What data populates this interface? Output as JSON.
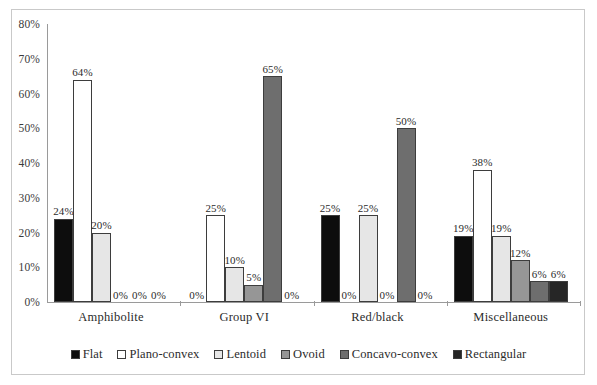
{
  "chart_data": {
    "type": "bar",
    "title": "",
    "subtitle": "",
    "xlabel": "",
    "ylabel": "",
    "categories": [
      "Amphibolite",
      "Group VI",
      "Red/black",
      "Miscellaneous"
    ],
    "series": [
      {
        "name": "Flat",
        "color": "#0d0d0d",
        "values": [
          24,
          0,
          25,
          19
        ],
        "labels": [
          "24%",
          "0%",
          "25%",
          "19%"
        ]
      },
      {
        "name": "Plano-convex",
        "color": "#ffffff",
        "values": [
          64,
          25,
          0,
          38
        ],
        "labels": [
          "64%",
          "25%",
          "0%",
          "38%"
        ]
      },
      {
        "name": "Lentoid",
        "color": "#e6e6e6",
        "values": [
          20,
          10,
          25,
          19
        ],
        "labels": [
          "20%",
          "10%",
          "25%",
          "19%"
        ]
      },
      {
        "name": "Ovoid",
        "color": "#969696",
        "values": [
          0,
          5,
          0,
          12
        ],
        "labels": [
          "0%",
          "5%",
          "0%",
          "12%"
        ]
      },
      {
        "name": "Concavo-convex",
        "color": "#6e6e6e",
        "values": [
          0,
          65,
          50,
          6
        ],
        "labels": [
          "0%",
          "65%",
          "50%",
          "6%"
        ]
      },
      {
        "name": "Rectangular",
        "color": "#262626",
        "values": [
          0,
          0,
          0,
          6
        ],
        "labels": [
          "0%",
          "0%",
          "0%",
          "6%"
        ]
      }
    ],
    "ylim": [
      0,
      80
    ],
    "yticks": [
      0,
      10,
      20,
      30,
      40,
      50,
      60,
      70,
      80
    ],
    "ytick_labels": [
      "0%",
      "10%",
      "20%",
      "30%",
      "40%",
      "50%",
      "60%",
      "70%",
      "80%"
    ],
    "grid": false,
    "legend_position": "bottom",
    "value_labels_shown": true,
    "bar_outline_color": "#3d3d3d",
    "axis_color": "#9a9a9a",
    "frame_color": "#c9c9c9",
    "background": "#ffffff"
  }
}
